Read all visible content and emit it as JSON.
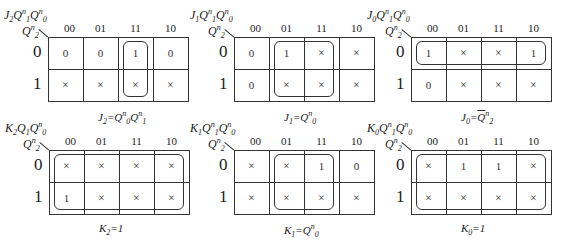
{
  "column_codes": [
    "00",
    "01",
    "11",
    "10"
  ],
  "row_codes": [
    "0",
    "1"
  ],
  "maps": [
    {
      "id": "J2",
      "corner_label": {
        "out": "J",
        "out_sub": "2",
        "v1": "Q",
        "v1_sub": "1",
        "v1_sup": "n",
        "v0": "Q",
        "v0_sub": "0",
        "v0_sup": "n",
        "row": "Q",
        "row_sub": "2",
        "row_sup": "n"
      },
      "cells": [
        [
          "0",
          "0",
          "1",
          "0"
        ],
        [
          "×",
          "×",
          "×",
          "×"
        ]
      ],
      "loops": [
        {
          "cols": [
            2,
            2
          ],
          "rows": [
            0,
            1
          ]
        }
      ],
      "caption": {
        "lhs": "J",
        "lhs_sub": "2",
        "eq": "=",
        "terms": [
          {
            "v": "Q",
            "sub": "0",
            "sup": "n"
          },
          {
            "v": "Q",
            "sub": "1",
            "sup": "n"
          }
        ]
      }
    },
    {
      "id": "J1",
      "corner_label": {
        "out": "J",
        "out_sub": "1",
        "v1": "Q",
        "v1_sub": "1",
        "v1_sup": "n",
        "v0": "Q",
        "v0_sub": "0",
        "v0_sup": "n",
        "row": "Q",
        "row_sub": "2",
        "row_sup": "n"
      },
      "cells": [
        [
          "0",
          "1",
          "×",
          "×"
        ],
        [
          "0",
          "×",
          "×",
          "×"
        ]
      ],
      "loops": [
        {
          "cols": [
            1,
            2
          ],
          "rows": [
            0,
            1
          ]
        }
      ],
      "caption": {
        "lhs": "J",
        "lhs_sub": "1",
        "eq": "=",
        "terms": [
          {
            "v": "Q",
            "sub": "0",
            "sup": "n"
          }
        ]
      }
    },
    {
      "id": "J0",
      "corner_label": {
        "out": "J",
        "out_sub": "0",
        "v1": "Q",
        "v1_sub": "1",
        "v1_sup": "n",
        "v0": "Q",
        "v0_sub": "0",
        "v0_sup": "n",
        "row": "Q",
        "row_sub": "2",
        "row_sup": "n"
      },
      "cells": [
        [
          "1",
          "×",
          "×",
          "1"
        ],
        [
          "0",
          "×",
          "×",
          "×"
        ]
      ],
      "loops": [
        {
          "cols": [
            0,
            3
          ],
          "rows": [
            0,
            0
          ]
        }
      ],
      "caption": {
        "lhs": "J",
        "lhs_sub": "0",
        "eq": "=",
        "terms": [
          {
            "v": "Q",
            "sub": "2",
            "sup": "n",
            "overline": true
          }
        ]
      }
    },
    {
      "id": "K2",
      "corner_label": {
        "out": "K",
        "out_sub": "2",
        "v1": "Q",
        "v1_sub": "1",
        "v1_sup": "",
        "v0": "Q",
        "v0_sub": "0",
        "v0_sup": "n",
        "row": "Q",
        "row_sub": "2",
        "row_sup": "n"
      },
      "cells": [
        [
          "×",
          "×",
          "×",
          "×"
        ],
        [
          "1",
          "×",
          "×",
          "×"
        ]
      ],
      "loops": [
        {
          "cols": [
            0,
            3
          ],
          "rows": [
            0,
            1
          ]
        }
      ],
      "caption": {
        "lhs": "K",
        "lhs_sub": "2",
        "eq": "=",
        "value": "1"
      }
    },
    {
      "id": "K1",
      "corner_label": {
        "out": "K",
        "out_sub": "1",
        "v1": "Q",
        "v1_sub": "1",
        "v1_sup": "n",
        "v0": "Q",
        "v0_sub": "0",
        "v0_sup": "n",
        "row": "Q",
        "row_sub": "2",
        "row_sup": "n"
      },
      "cells": [
        [
          "×",
          "×",
          "1",
          "0"
        ],
        [
          "×",
          "×",
          "×",
          "×"
        ]
      ],
      "loops": [
        {
          "cols": [
            1,
            2
          ],
          "rows": [
            0,
            1
          ]
        }
      ],
      "caption": {
        "lhs": "K",
        "lhs_sub": "1",
        "eq": "=",
        "terms": [
          {
            "v": "Q",
            "sub": "0",
            "sup": "n"
          }
        ]
      }
    },
    {
      "id": "K0",
      "corner_label": {
        "out": "K",
        "out_sub": "0",
        "v1": "Q",
        "v1_sub": "1",
        "v1_sup": "n",
        "v0": "Q",
        "v0_sub": "0",
        "v0_sup": "n",
        "row": "Q",
        "row_sub": "2",
        "row_sup": "n"
      },
      "cells": [
        [
          "×",
          "1",
          "1",
          "×"
        ],
        [
          "×",
          "×",
          "×",
          "×"
        ]
      ],
      "loops": [
        {
          "cols": [
            0,
            3
          ],
          "rows": [
            0,
            1
          ]
        }
      ],
      "caption": {
        "lhs": "K",
        "lhs_sub": "0",
        "eq": "=",
        "value": "1"
      }
    }
  ]
}
